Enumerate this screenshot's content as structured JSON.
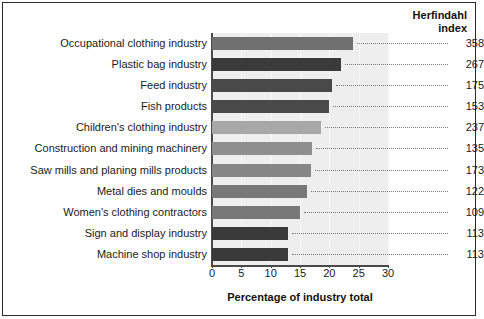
{
  "header": {
    "right_title_line1": "Herfindahl",
    "right_title_line2": "index"
  },
  "axis": {
    "x_title": "Percentage of industry total",
    "ticks": [
      "0",
      "5",
      "10",
      "15",
      "20",
      "25",
      "30"
    ]
  },
  "chart_data": {
    "type": "bar",
    "orientation": "horizontal",
    "title": "",
    "xlabel": "Percentage of industry total",
    "ylabel": "",
    "xlim": [
      0,
      30
    ],
    "grid": false,
    "legend": "none",
    "value_column_label": "Herfindahl index",
    "categories": [
      "Occupational clothing industry",
      "Plastic bag industry",
      "Feed industry",
      "Fish products",
      "Children's clothing industry",
      "Construction and mining machinery",
      "Saw mills and planing mills products",
      "Metal dies and moulds",
      "Women's clothing contractors",
      "Sign and display industry",
      "Machine shop industry"
    ],
    "values": [
      24.0,
      22.0,
      20.5,
      20.0,
      18.5,
      17.0,
      16.8,
      16.2,
      15.0,
      13.0,
      13.0
    ],
    "herfindahl_index": [
      358,
      267,
      175,
      153,
      237,
      135,
      173,
      122,
      109,
      113,
      113
    ],
    "bar_colors": [
      "#707070",
      "#3a3a3a",
      "#4a4a4a",
      "#4a4a4a",
      "#a8a8a8",
      "#8e8e8e",
      "#868686",
      "#787878",
      "#787878",
      "#3a3a3a",
      "#3a3a3a"
    ]
  },
  "style": {
    "plot_background": "#eeeeee",
    "axis_color": "#4a4a4a",
    "text_color": "#1a1a1a"
  }
}
